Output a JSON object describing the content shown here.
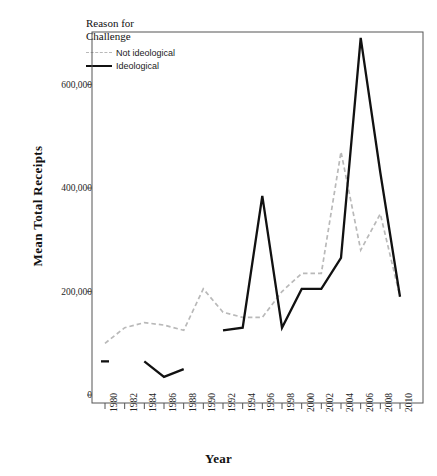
{
  "chart_data": {
    "type": "line",
    "title": "",
    "xlabel": "Year",
    "ylabel": "Mean Total Receipts",
    "x": [
      1980,
      1982,
      1984,
      1986,
      1988,
      1990,
      1992,
      1994,
      1996,
      1998,
      2000,
      2002,
      2004,
      2006,
      2008,
      2010
    ],
    "xlim": [
      1980,
      2010
    ],
    "ylim": [
      0,
      700000
    ],
    "xticks": [
      "1980",
      "1982",
      "1984",
      "1986",
      "1988",
      "1990",
      "1992",
      "1994",
      "1996",
      "1998",
      "2000",
      "2002",
      "2004",
      "2006",
      "2008",
      "2010"
    ],
    "yticks": [
      "0",
      "200,000",
      "400,000",
      "600,000"
    ],
    "ytick_values": [
      0,
      200000,
      400000,
      600000
    ],
    "grid": false,
    "legend_position": "top-left",
    "legend_title_lines": [
      "Reason for",
      "Challenge"
    ],
    "series": [
      {
        "name": "Not ideological",
        "style": "dashed",
        "color": "#b9b9b9",
        "values": [
          100000,
          130000,
          140000,
          135000,
          125000,
          205000,
          160000,
          150000,
          150000,
          200000,
          235000,
          235000,
          470000,
          280000,
          350000,
          190000
        ]
      },
      {
        "name": "Ideological",
        "style": "solid",
        "color": "#111111",
        "values": [
          65000,
          null,
          65000,
          35000,
          50000,
          null,
          125000,
          130000,
          385000,
          130000,
          205000,
          205000,
          265000,
          690000,
          430000,
          190000
        ]
      }
    ]
  },
  "axis": {
    "y_title": "Mean Total Receipts",
    "x_title": "Year"
  },
  "legend": {
    "title_line1": "Reason for",
    "title_line2": "Challenge",
    "items": [
      {
        "label": "Not ideological"
      },
      {
        "label": "Ideological"
      }
    ]
  }
}
